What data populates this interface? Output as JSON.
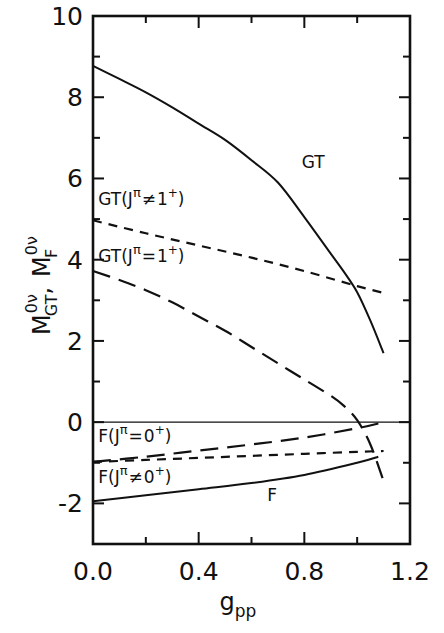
{
  "chart_data": {
    "type": "line",
    "title": "",
    "xlabel": "g_pp",
    "ylabel": "M^{0ν}_{GT}, M^{0ν}_{F}",
    "xlim": [
      0.0,
      1.2
    ],
    "ylim": [
      -3,
      10
    ],
    "grid": false,
    "legend": "none (inline curve annotations)",
    "x_ticks": [
      {
        "value": 0.0,
        "label": "0.0"
      },
      {
        "value": 0.4,
        "label": "0.4"
      },
      {
        "value": 0.8,
        "label": "0.8"
      },
      {
        "value": 1.2,
        "label": "1.2"
      }
    ],
    "x_minor_ticks": [
      0.2,
      0.6,
      1.0
    ],
    "y_ticks": [
      {
        "value": 10,
        "label": "10"
      },
      {
        "value": 8,
        "label": "8"
      },
      {
        "value": 6,
        "label": "6"
      },
      {
        "value": 4,
        "label": "4"
      },
      {
        "value": 2,
        "label": "2"
      },
      {
        "value": 0,
        "label": "0"
      },
      {
        "value": -2,
        "label": "-2"
      }
    ],
    "y_minor_ticks": [
      9,
      7,
      5,
      3,
      1,
      -1,
      -3
    ],
    "reference_line": {
      "y": 0,
      "style": "thin-solid"
    },
    "series": [
      {
        "name": "GT",
        "label": "GT",
        "style": "solid",
        "x": [
          0.0,
          0.1,
          0.2,
          0.3,
          0.4,
          0.5,
          0.6,
          0.7,
          0.8,
          0.9,
          0.95,
          1.0,
          1.05,
          1.1
        ],
        "y": [
          8.77,
          8.45,
          8.12,
          7.75,
          7.35,
          6.95,
          6.45,
          5.9,
          5.05,
          4.15,
          3.7,
          3.2,
          2.5,
          1.7
        ]
      },
      {
        "name": "GT(Jπ≠1+)",
        "label": "GT(J",
        "label_sup": "π",
        "label_rel": "≠",
        "label_tail": "1",
        "label_tail_sup": "+",
        "label_close": ")",
        "style": "short-dash",
        "x": [
          0.0,
          0.2,
          0.4,
          0.6,
          0.8,
          1.0,
          1.1
        ],
        "y": [
          4.97,
          4.65,
          4.35,
          4.05,
          3.72,
          3.35,
          3.18
        ]
      },
      {
        "name": "GT(Jπ=1+)",
        "label": "GT(J",
        "label_sup": "π",
        "label_rel": "=",
        "label_tail": "1",
        "label_tail_sup": "+",
        "label_close": ")",
        "style": "long-dash",
        "x": [
          0.0,
          0.1,
          0.2,
          0.3,
          0.4,
          0.5,
          0.6,
          0.7,
          0.8,
          0.9,
          0.95,
          1.0,
          1.05,
          1.1
        ],
        "y": [
          3.72,
          3.5,
          3.25,
          2.95,
          2.6,
          2.25,
          1.85,
          1.45,
          1.05,
          0.65,
          0.4,
          0.05,
          -0.55,
          -1.45
        ]
      },
      {
        "name": "F(Jπ=0+)",
        "label": "F(J",
        "label_sup": "π",
        "label_rel": "=",
        "label_tail": "0",
        "label_tail_sup": "+",
        "label_close": ")",
        "style": "long-dash",
        "x": [
          0.0,
          0.2,
          0.4,
          0.6,
          0.8,
          1.0,
          1.1
        ],
        "y": [
          -0.98,
          -0.85,
          -0.7,
          -0.55,
          -0.38,
          -0.15,
          0.0
        ]
      },
      {
        "name": "F(Jπ≠0+)",
        "label": "F(J",
        "label_sup": "π",
        "label_rel": "≠",
        "label_tail": "0",
        "label_tail_sup": "+",
        "label_close": ")",
        "style": "short-dash",
        "x": [
          0.0,
          0.2,
          0.4,
          0.6,
          0.8,
          1.0,
          1.1
        ],
        "y": [
          -0.98,
          -0.93,
          -0.88,
          -0.83,
          -0.78,
          -0.73,
          -0.71
        ]
      },
      {
        "name": "F",
        "label": "F",
        "style": "solid",
        "x": [
          0.0,
          0.2,
          0.4,
          0.6,
          0.8,
          1.0,
          1.08
        ],
        "y": [
          -1.95,
          -1.8,
          -1.65,
          -1.5,
          -1.3,
          -1.0,
          -0.85
        ]
      }
    ],
    "annotations": [
      {
        "text": "GT",
        "series": "GT",
        "x": 0.79,
        "y": 6.25
      },
      {
        "text": "GT(Jπ≠1+)",
        "series": "GT(Jπ≠1+)",
        "x": 0.02,
        "y": 5.35
      },
      {
        "text": "GT(Jπ=1+)",
        "series": "GT(Jπ=1+)",
        "x": 0.02,
        "y": 3.95
      },
      {
        "text": "F(Jπ=0+)",
        "series": "F(Jπ=0+)",
        "x": 0.02,
        "y": -0.5
      },
      {
        "text": "F(Jπ≠0+)",
        "series": "F(Jπ≠0+)",
        "x": 0.02,
        "y": -1.5
      },
      {
        "text": "F",
        "series": "F",
        "x": 0.66,
        "y": -1.95
      }
    ]
  },
  "labels": {
    "x_axis_main": "g",
    "x_axis_sub": "pp",
    "y_axis_M1": "M",
    "y_axis_sup1": "0ν",
    "y_axis_sub1": "GT",
    "y_axis_sep": ",",
    "y_axis_M2": "M",
    "y_axis_sup2": "0ν",
    "y_axis_sub2": "F"
  }
}
